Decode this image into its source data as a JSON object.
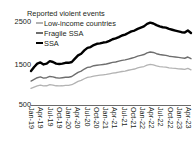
{
  "chart_data": {
    "type": "line",
    "title": "Reported violent events",
    "xlabel": "",
    "ylabel": "",
    "ylim": [
      500,
      2700
    ],
    "yticks": [
      2500,
      1500,
      500
    ],
    "grid": false,
    "legend_position": "top-left",
    "x_tick_labels": [
      "Jan-19",
      "Apr-19",
      "Jul-19",
      "Oct-19",
      "Jan-20",
      "Apr-20",
      "Jul-20",
      "Oct-20",
      "Jan-21",
      "Apr-21",
      "Jul-21",
      "Oct-21",
      "Jan-22",
      "Apr-22",
      "Jul-22",
      "Oct-22",
      "Jan-23",
      "Apr-23"
    ],
    "x": [
      "Jan-19",
      "Feb-19",
      "Mar-19",
      "Apr-19",
      "May-19",
      "Jun-19",
      "Jul-19",
      "Aug-19",
      "Sep-19",
      "Oct-19",
      "Nov-19",
      "Dec-19",
      "Jan-20",
      "Feb-20",
      "Mar-20",
      "Apr-20",
      "May-20",
      "Jun-20",
      "Jul-20",
      "Aug-20",
      "Sep-20",
      "Oct-20",
      "Nov-20",
      "Dec-20",
      "Jan-21",
      "Feb-21",
      "Mar-21",
      "Apr-21",
      "May-21",
      "Jun-21",
      "Jul-21",
      "Aug-21",
      "Sep-21",
      "Oct-21",
      "Nov-21",
      "Dec-21",
      "Jan-22",
      "Feb-22",
      "Mar-22",
      "Apr-22",
      "May-22",
      "Jun-22",
      "Jul-22",
      "Aug-22",
      "Sep-22",
      "Oct-22",
      "Nov-22",
      "Dec-22",
      "Jan-23",
      "Feb-23",
      "Mar-23",
      "Apr-23"
    ],
    "series": [
      {
        "name": "SSA",
        "color": "#000000",
        "width": 2.4,
        "values": [
          1320,
          1420,
          1500,
          1530,
          1480,
          1500,
          1560,
          1540,
          1500,
          1490,
          1500,
          1520,
          1520,
          1540,
          1620,
          1700,
          1740,
          1820,
          1880,
          1900,
          1950,
          1980,
          1990,
          2010,
          2020,
          2050,
          2090,
          2110,
          2140,
          2180,
          2200,
          2240,
          2280,
          2300,
          2340,
          2370,
          2400,
          2460,
          2490,
          2470,
          2430,
          2400,
          2380,
          2370,
          2340,
          2320,
          2300,
          2280,
          2260,
          2250,
          2300,
          2240
        ]
      },
      {
        "name": "Fragile SSA",
        "color": "#6e6e6e",
        "width": 1.4,
        "values": [
          1080,
          1120,
          1160,
          1180,
          1150,
          1160,
          1190,
          1180,
          1160,
          1150,
          1160,
          1170,
          1170,
          1190,
          1240,
          1290,
          1320,
          1370,
          1410,
          1420,
          1450,
          1460,
          1470,
          1480,
          1490,
          1510,
          1530,
          1540,
          1560,
          1580,
          1590,
          1610,
          1630,
          1650,
          1680,
          1700,
          1720,
          1760,
          1780,
          1770,
          1740,
          1720,
          1710,
          1700,
          1680,
          1670,
          1660,
          1650,
          1640,
          1630,
          1660,
          1620
        ]
      },
      {
        "name": "Low-income countries",
        "color": "#b3b3b3",
        "width": 1.3,
        "values": [
          900,
          930,
          960,
          980,
          960,
          965,
          990,
          980,
          965,
          960,
          965,
          975,
          975,
          990,
          1030,
          1070,
          1095,
          1135,
          1170,
          1180,
          1200,
          1210,
          1220,
          1230,
          1240,
          1255,
          1270,
          1280,
          1295,
          1310,
          1320,
          1340,
          1355,
          1370,
          1395,
          1415,
          1430,
          1465,
          1480,
          1470,
          1445,
          1430,
          1420,
          1415,
          1400,
          1390,
          1385,
          1375,
          1370,
          1360,
          1385,
          1350
        ]
      }
    ]
  },
  "axis": {
    "ytick_0": "2500",
    "ytick_1": "1500",
    "ytick_2": "500"
  },
  "legend": {
    "items": [
      {
        "label": "Low-income countries",
        "marker": "line-swatch-light"
      },
      {
        "label": "Fragile SSA",
        "marker": "line-swatch-medium"
      },
      {
        "label": "SSA",
        "marker": "line-swatch-black"
      }
    ]
  }
}
